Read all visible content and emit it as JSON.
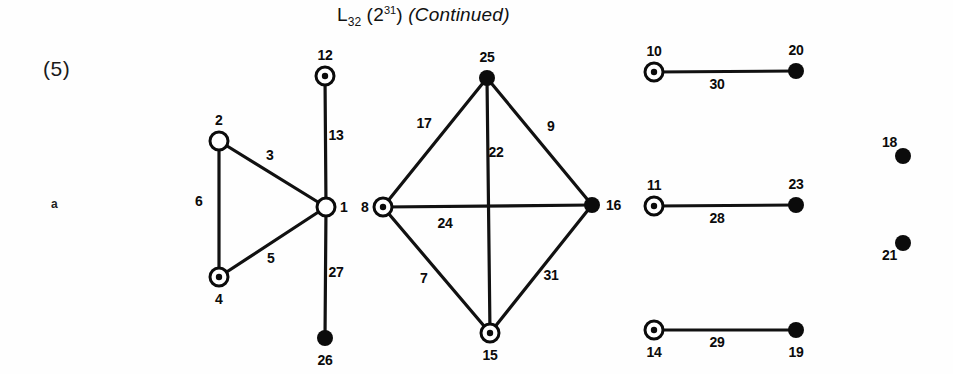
{
  "figure": {
    "title_main": "L",
    "title_sub": "32",
    "title_paren_open": " (2",
    "title_sup": "31",
    "title_paren_close": ")",
    "title_continued": "(Continued)",
    "section_number": "(5)",
    "side_marker": "a"
  },
  "chart_data": {
    "type": "diagram",
    "node_styles": {
      "hollow": "open circle outline",
      "dotted": "circle with filled center dot",
      "filled": "solid black disc"
    },
    "nodes": [
      {
        "id": "2",
        "label": "2",
        "x": 219,
        "y": 141,
        "style": "hollow",
        "label_pos": "above"
      },
      {
        "id": "4",
        "label": "4",
        "x": 219,
        "y": 277,
        "style": "dotted",
        "label_pos": "below"
      },
      {
        "id": "1",
        "label": "1",
        "x": 326,
        "y": 207,
        "style": "hollow",
        "label_pos": "right"
      },
      {
        "id": "12",
        "label": "12",
        "x": 325,
        "y": 76,
        "style": "dotted",
        "label_pos": "above"
      },
      {
        "id": "26",
        "label": "26",
        "x": 325,
        "y": 338,
        "style": "filled",
        "label_pos": "below"
      },
      {
        "id": "8",
        "label": "8",
        "x": 383,
        "y": 207,
        "style": "dotted",
        "label_pos": "left"
      },
      {
        "id": "25",
        "label": "25",
        "x": 487,
        "y": 78,
        "style": "filled",
        "label_pos": "above"
      },
      {
        "id": "16",
        "label": "16",
        "x": 592,
        "y": 205,
        "style": "filled",
        "label_pos": "right"
      },
      {
        "id": "15",
        "label": "15",
        "x": 490,
        "y": 333,
        "style": "dotted",
        "label_pos": "below"
      },
      {
        "id": "10",
        "label": "10",
        "x": 654,
        "y": 72,
        "style": "dotted",
        "label_pos": "above"
      },
      {
        "id": "20",
        "label": "20",
        "x": 796,
        "y": 71,
        "style": "filled",
        "label_pos": "above"
      },
      {
        "id": "11",
        "label": "11",
        "x": 654,
        "y": 206,
        "style": "dotted",
        "label_pos": "above"
      },
      {
        "id": "23",
        "label": "23",
        "x": 796,
        "y": 205,
        "style": "filled",
        "label_pos": "above"
      },
      {
        "id": "14",
        "label": "14",
        "x": 654,
        "y": 330,
        "style": "dotted",
        "label_pos": "below"
      },
      {
        "id": "19",
        "label": "19",
        "x": 796,
        "y": 330,
        "style": "filled",
        "label_pos": "below"
      },
      {
        "id": "18",
        "label": "18",
        "x": 903,
        "y": 156,
        "style": "filled",
        "label_pos": "above-left"
      },
      {
        "id": "21",
        "label": "21",
        "x": 903,
        "y": 243,
        "style": "filled",
        "label_pos": "below-left"
      }
    ],
    "edges": [
      {
        "label": "3",
        "from": "2",
        "to": "1",
        "label_x": 270,
        "label_y": 155
      },
      {
        "label": "6",
        "from": "2",
        "to": "4",
        "label_x": 199,
        "label_y": 201
      },
      {
        "label": "5",
        "from": "4",
        "to": "1",
        "label_x": 271,
        "label_y": 258
      },
      {
        "label": "13",
        "from": "12",
        "to": "1",
        "label_x": 336,
        "label_y": 135
      },
      {
        "label": "27",
        "from": "1",
        "to": "26",
        "label_x": 336,
        "label_y": 272
      },
      {
        "label": "17",
        "from": "8",
        "to": "25",
        "label_x": 424,
        "label_y": 123
      },
      {
        "label": "9",
        "from": "25",
        "to": "16",
        "label_x": 551,
        "label_y": 126
      },
      {
        "label": "22",
        "from": "25",
        "to": "15",
        "label_x": 496,
        "label_y": 152
      },
      {
        "label": "24",
        "from": "8",
        "to": "16",
        "label_x": 445,
        "label_y": 223
      },
      {
        "label": "7",
        "from": "8",
        "to": "15",
        "label_x": 424,
        "label_y": 278
      },
      {
        "label": "31",
        "from": "15",
        "to": "16",
        "label_x": 551,
        "label_y": 275
      },
      {
        "label": "30",
        "from": "10",
        "to": "20",
        "label_x": 717,
        "label_y": 84
      },
      {
        "label": "28",
        "from": "11",
        "to": "23",
        "label_x": 717,
        "label_y": 218
      },
      {
        "label": "29",
        "from": "14",
        "to": "19",
        "label_x": 717,
        "label_y": 342
      }
    ]
  }
}
